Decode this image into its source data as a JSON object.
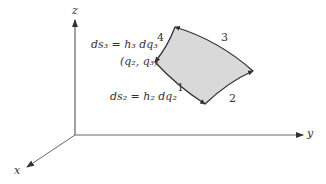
{
  "axes": {
    "z_label": "z",
    "y_label": "y",
    "x_label": "x"
  },
  "patch": {
    "fill_color": "#d9d9d9",
    "edge_color": "#333333",
    "corner_label": "(q₂, q₃)",
    "edge_labels": [
      "1",
      "2",
      "3",
      "4"
    ]
  },
  "annotations": {
    "ds3": "ds₃ = h₃ dq₃",
    "ds2": "ds₂ = h₂ dq₂"
  }
}
